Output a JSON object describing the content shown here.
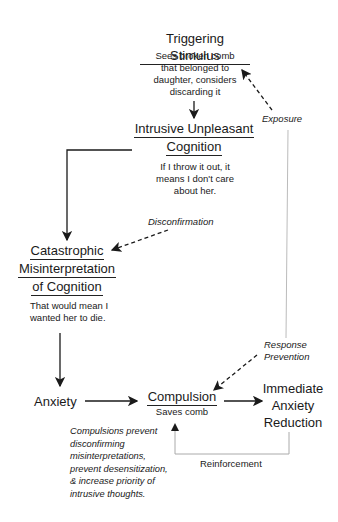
{
  "diagram": {
    "nodes": {
      "triggering_stimulus": {
        "title": "Triggering Stimulus",
        "body": [
          "Sees broken comb",
          "that belonged to",
          "daughter, considers",
          "discarding it"
        ]
      },
      "intrusive_cognition": {
        "title_lines": [
          "Intrusive Unpleasant",
          "Cognition"
        ],
        "body": [
          "If I throw it out, it",
          "means I don't care",
          "about her."
        ]
      },
      "catastrophic_misinterpretation": {
        "title_lines": [
          "Catastrophic",
          "Misinterpretation",
          "of Cognition"
        ],
        "body": [
          "That would mean I",
          "wanted her to die."
        ]
      },
      "anxiety": {
        "title": "Anxiety"
      },
      "compulsion": {
        "title": "Compulsion",
        "body": "Saves comb"
      },
      "immediate_anxiety_reduction": {
        "title_lines": [
          "Immediate",
          "Anxiety",
          "Reduction"
        ]
      }
    },
    "edge_labels": {
      "exposure": "Exposure",
      "disconfirmation": "Disconfirmation",
      "response_prevention": [
        "Response",
        "Prevention"
      ],
      "reinforcement": "Reinforcement"
    },
    "note": [
      "Compulsions prevent",
      "disconfirming",
      "misinterpretations,",
      "prevent desensitization,",
      "& increase priority of",
      "intrusive thoughts."
    ],
    "colors": {
      "line": "#1a1a1a",
      "feedback_line": "#aaaaaa"
    }
  }
}
